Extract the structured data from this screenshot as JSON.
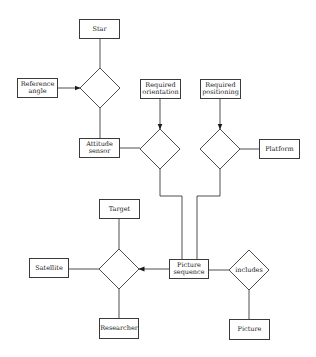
{
  "diagram": {
    "type": "entity-relationship",
    "colors": {
      "stroke": "#3a3a3a",
      "background": "#ffffff",
      "text": "#1a1a1a"
    },
    "entities": [
      {
        "id": "star",
        "label": "Star",
        "x": 79,
        "y": 19,
        "w": 41,
        "h": 20
      },
      {
        "id": "reference-angle",
        "label": "Reference\nangle",
        "x": 17,
        "y": 78,
        "w": 41,
        "h": 20
      },
      {
        "id": "attitude-sensor",
        "label": "Attitude\nsensor",
        "x": 79,
        "y": 138,
        "w": 41,
        "h": 20
      },
      {
        "id": "required-orientation",
        "label": "Required\norientation",
        "x": 140,
        "y": 79,
        "w": 41,
        "h": 20
      },
      {
        "id": "required-positioning",
        "label": "Required\npositioning",
        "x": 200,
        "y": 79,
        "w": 41,
        "h": 20
      },
      {
        "id": "platform",
        "label": "Platform",
        "x": 259,
        "y": 139,
        "w": 41,
        "h": 20
      },
      {
        "id": "target",
        "label": "Target",
        "x": 99,
        "y": 199,
        "w": 41,
        "h": 20
      },
      {
        "id": "satellite",
        "label": "Satellite",
        "x": 29,
        "y": 258,
        "w": 40,
        "h": 20
      },
      {
        "id": "picture-sequence",
        "label": "Picture\nsequence",
        "x": 169,
        "y": 259,
        "w": 40,
        "h": 20
      },
      {
        "id": "researcher",
        "label": "Researcher",
        "x": 99,
        "y": 318,
        "w": 40,
        "h": 21
      },
      {
        "id": "picture",
        "label": "Picture",
        "x": 229,
        "y": 319,
        "w": 41,
        "h": 21
      }
    ],
    "relationships": [
      {
        "id": "star-relation",
        "label": "",
        "cx": 100,
        "cy": 88,
        "r": 20
      },
      {
        "id": "orientation-relation",
        "label": "",
        "cx": 160,
        "cy": 149,
        "r": 20
      },
      {
        "id": "positioning-relation",
        "label": "",
        "cx": 220,
        "cy": 149,
        "r": 20
      },
      {
        "id": "target-relation",
        "label": "",
        "cx": 119,
        "cy": 269,
        "r": 20
      },
      {
        "id": "includes-relation",
        "label": "includes",
        "cx": 249,
        "cy": 270,
        "r": 20
      }
    ],
    "connectors": [
      {
        "from": "star",
        "to": "star-relation",
        "points": [
          [
            100,
            39
          ],
          [
            100,
            68
          ]
        ],
        "arrow": false
      },
      {
        "from": "reference-angle",
        "to": "star-relation",
        "points": [
          [
            58,
            88
          ],
          [
            80,
            88
          ]
        ],
        "arrow": true
      },
      {
        "from": "star-relation",
        "to": "attitude-sensor",
        "points": [
          [
            100,
            108
          ],
          [
            100,
            138
          ]
        ],
        "arrow": false
      },
      {
        "from": "attitude-sensor",
        "to": "orientation-relation",
        "points": [
          [
            120,
            148
          ],
          [
            140,
            148
          ]
        ],
        "arrow": false
      },
      {
        "from": "required-orientation",
        "to": "orientation-relation",
        "points": [
          [
            160,
            99
          ],
          [
            160,
            129
          ]
        ],
        "arrow": true
      },
      {
        "from": "required-positioning",
        "to": "positioning-relation",
        "points": [
          [
            220,
            99
          ],
          [
            220,
            129
          ]
        ],
        "arrow": true
      },
      {
        "from": "positioning-relation",
        "to": "platform",
        "points": [
          [
            240,
            149
          ],
          [
            259,
            149
          ]
        ],
        "arrow": false
      },
      {
        "from": "orientation-relation",
        "to": "picture-sequence",
        "points": [
          [
            160,
            169
          ],
          [
            160,
            196
          ],
          [
            182,
            196
          ],
          [
            182,
            259
          ]
        ],
        "arrow": false
      },
      {
        "from": "positioning-relation",
        "to": "picture-sequence",
        "points": [
          [
            220,
            169
          ],
          [
            220,
            196
          ],
          [
            197,
            196
          ],
          [
            197,
            259
          ]
        ],
        "arrow": false
      },
      {
        "from": "target",
        "to": "target-relation",
        "points": [
          [
            119,
            219
          ],
          [
            119,
            249
          ]
        ],
        "arrow": false
      },
      {
        "from": "satellite",
        "to": "target-relation",
        "points": [
          [
            69,
            269
          ],
          [
            99,
            269
          ]
        ],
        "arrow": false
      },
      {
        "from": "picture-sequence",
        "to": "target-relation",
        "points": [
          [
            169,
            269
          ],
          [
            139,
            269
          ]
        ],
        "arrow": true
      },
      {
        "from": "target-relation",
        "to": "researcher",
        "points": [
          [
            119,
            289
          ],
          [
            119,
            318
          ]
        ],
        "arrow": false
      },
      {
        "from": "picture-sequence",
        "to": "includes-relation",
        "points": [
          [
            209,
            270
          ],
          [
            229,
            270
          ]
        ],
        "arrow": false
      },
      {
        "from": "includes-relation",
        "to": "picture",
        "points": [
          [
            249,
            290
          ],
          [
            249,
            319
          ]
        ],
        "arrow": false
      }
    ]
  }
}
